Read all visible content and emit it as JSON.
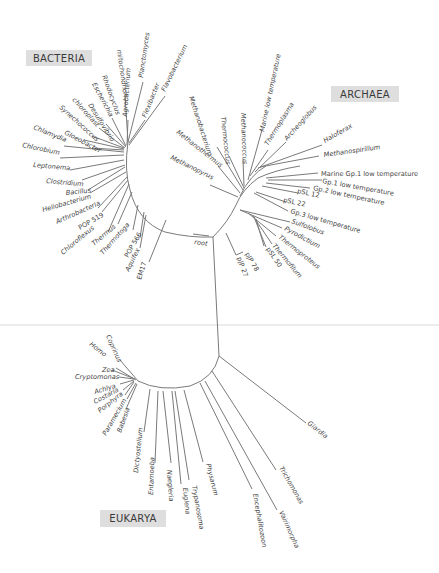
{
  "diagram": {
    "type": "universal phylogenetic tree (unrooted radial)",
    "root_label": "root",
    "colors": {
      "branch": "#7a7a7a",
      "label_box": "#dedede",
      "text": "#444444",
      "background": "#ffffff"
    },
    "domains": {
      "bacteria": {
        "label": "BACTERIA",
        "taxa": [
          "mitochondrion",
          "Planctomyces",
          "Flavobacterium",
          "Flexibacter",
          "Agrobacterium",
          "Rhodocyclus",
          "Escherichia",
          "Desulfovibrio",
          "chloroplast",
          "Synechococcus",
          "Gloeobacter",
          "Chlamydia",
          "Chlorobium",
          "Leptonema",
          "Clostridium",
          "Bacillus",
          "Heliobacterium",
          "Arthrobacteria",
          "POP 519",
          "Chloroflexus",
          "Thermus",
          "Thermotoga",
          "POP 566",
          "Aquifex",
          "EM17"
        ]
      },
      "archaea": {
        "label": "ARCHAEA",
        "taxa": [
          "Methanobacterium",
          "Thermococcus",
          "Methanococcus",
          "Marine low temperature",
          "Thermoplasma",
          "Archeoglobus",
          "Haloferax",
          "Methanospirillum",
          "Marine Gp.1 low temperature",
          "Gp.1 low temperature",
          "Gp.2 low temperature",
          "pSL 12",
          "pSL 22",
          "Gp.3 low temperature",
          "Sulfolobus",
          "Pyrodictium",
          "Thermoproteus",
          "Thermofilum",
          "pSL 50",
          "pJP 78",
          "pJP 27",
          "Methanothermus",
          "Methanopyrus"
        ]
      },
      "eukarya": {
        "label": "EUKARYA",
        "taxa": [
          "Coprinus",
          "Homo",
          "Zea",
          "Cryptomonas",
          "Achlya",
          "Costaria",
          "Porphyra",
          "Paramecium",
          "Babesia",
          "Dictyostelium",
          "Entamoeba",
          "Naegleria",
          "Euglena",
          "Trypanosoma",
          "Physarum",
          "Encephalitozoon",
          "Vairimorpha",
          "Trichomonas",
          "Giardia"
        ]
      }
    }
  }
}
